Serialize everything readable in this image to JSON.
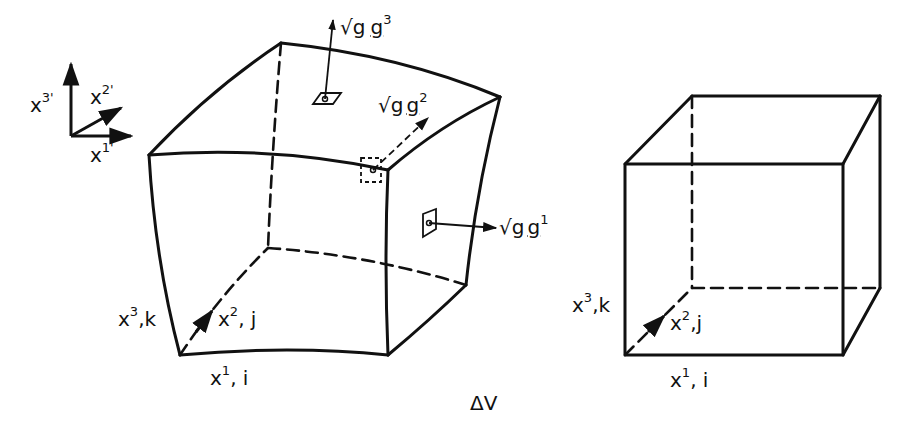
{
  "figure": {
    "caption_label": "ΔV",
    "colors": {
      "ink": "#111111",
      "background": "#ffffff"
    }
  },
  "axes_triad": {
    "x1": {
      "base": "x",
      "sup": "1'"
    },
    "x2": {
      "base": "x",
      "sup": "2'"
    },
    "x3": {
      "base": "x",
      "sup": "3'"
    }
  },
  "curved_cell": {
    "vectors": {
      "g3": {
        "root": "√g",
        "vec": "g",
        "sup": "3"
      },
      "g2": {
        "root": "√g",
        "vec": "g",
        "sup": "2"
      },
      "g1": {
        "root": "√g",
        "vec": "g",
        "sup": "1"
      }
    },
    "edge_labels": {
      "x1": {
        "base": "x",
        "sup": "1",
        "sub": ", i"
      },
      "x2": {
        "base": "x",
        "sup": "2",
        "sub": ", j"
      },
      "x3": {
        "base": "x",
        "sup": "3",
        "sub": ",k"
      }
    }
  },
  "cartesian_cube": {
    "edge_labels": {
      "x1": {
        "base": "x",
        "sup": "1",
        "sub": ", i"
      },
      "x2": {
        "base": "x",
        "sup": "2",
        "sub": ",j"
      },
      "x3": {
        "base": "x",
        "sup": "3",
        "sub": ",k"
      }
    }
  }
}
